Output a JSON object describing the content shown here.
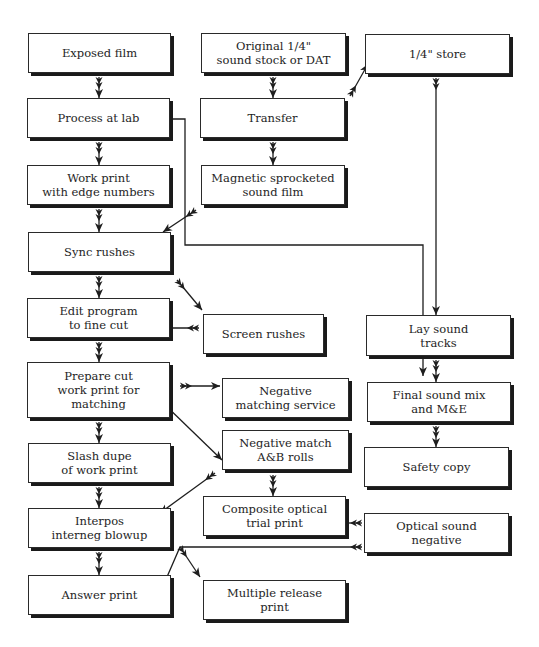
{
  "diagram": {
    "colors": {
      "ink": "#1e1e1e",
      "box_fill": "#ffffff",
      "shadow": "#1a1a1a"
    },
    "nodes": [
      {
        "id": "exposed-film",
        "label": "Exposed film",
        "x": 28,
        "y": 33,
        "w": 143,
        "h": 40
      },
      {
        "id": "original-sound",
        "label": "Original 1/4\"\nsound stock or DAT",
        "x": 201,
        "y": 33,
        "w": 145,
        "h": 40
      },
      {
        "id": "quarter-store",
        "label": "1/4\" store",
        "x": 365,
        "y": 34,
        "w": 145,
        "h": 40
      },
      {
        "id": "process-at-lab",
        "label": "Process at lab",
        "x": 27,
        "y": 98,
        "w": 143,
        "h": 40
      },
      {
        "id": "transfer",
        "label": "Transfer",
        "x": 200,
        "y": 98,
        "w": 145,
        "h": 40
      },
      {
        "id": "work-print",
        "label": "Work print\nwith edge numbers",
        "x": 27,
        "y": 165,
        "w": 143,
        "h": 40
      },
      {
        "id": "magnetic-film",
        "label": "Magnetic sprocketed\nsound film",
        "x": 201,
        "y": 165,
        "w": 144,
        "h": 40
      },
      {
        "id": "sync-rushes",
        "label": "Sync rushes",
        "x": 28,
        "y": 232,
        "w": 143,
        "h": 40
      },
      {
        "id": "edit-program",
        "label": "Edit program\nto fine cut",
        "x": 27,
        "y": 298,
        "w": 143,
        "h": 40
      },
      {
        "id": "screen-rushes",
        "label": "Screen rushes",
        "x": 203,
        "y": 314,
        "w": 121,
        "h": 40
      },
      {
        "id": "lay-sound",
        "label": "Lay sound\ntracks",
        "x": 366,
        "y": 315,
        "w": 145,
        "h": 41
      },
      {
        "id": "prepare-cut",
        "label": "Prepare cut\nwork print for\nmatching",
        "x": 27,
        "y": 362,
        "w": 143,
        "h": 56
      },
      {
        "id": "neg-matching-service",
        "label": "Negative\nmatching service",
        "x": 222,
        "y": 378,
        "w": 127,
        "h": 40
      },
      {
        "id": "final-mix",
        "label": "Final sound mix\nand M&E",
        "x": 367,
        "y": 382,
        "w": 144,
        "h": 40
      },
      {
        "id": "neg-match-ab",
        "label": "Negative match\nA&B rolls",
        "x": 222,
        "y": 430,
        "w": 127,
        "h": 40
      },
      {
        "id": "slash-dupe",
        "label": "Slash dupe\nof work print",
        "x": 28,
        "y": 443,
        "w": 143,
        "h": 40
      },
      {
        "id": "safety-copy",
        "label": "Safety copy",
        "x": 364,
        "y": 447,
        "w": 145,
        "h": 40
      },
      {
        "id": "composite",
        "label": "Composite optical\ntrial print",
        "x": 203,
        "y": 496,
        "w": 143,
        "h": 40
      },
      {
        "id": "interpos",
        "label": "Interpos\ninterneg blowup",
        "x": 28,
        "y": 508,
        "w": 143,
        "h": 40
      },
      {
        "id": "optical-sound-neg",
        "label": "Optical sound\nnegative",
        "x": 364,
        "y": 513,
        "w": 145,
        "h": 40
      },
      {
        "id": "answer-print",
        "label": "Answer print",
        "x": 28,
        "y": 575,
        "w": 143,
        "h": 40
      },
      {
        "id": "multiple-release",
        "label": "Multiple release\nprint",
        "x": 203,
        "y": 580,
        "w": 143,
        "h": 40
      }
    ],
    "edges": [
      {
        "from": "exposed-film",
        "to": "process-at-lab",
        "points": [
          [
            99,
            77
          ],
          [
            99,
            98
          ]
        ]
      },
      {
        "from": "process-at-lab",
        "to": "work-print",
        "points": [
          [
            99,
            142
          ],
          [
            99,
            165
          ]
        ]
      },
      {
        "from": "work-print",
        "to": "sync-rushes",
        "points": [
          [
            99,
            209
          ],
          [
            99,
            232
          ]
        ]
      },
      {
        "from": "sync-rushes",
        "to": "edit-program",
        "points": [
          [
            99,
            276
          ],
          [
            99,
            298
          ]
        ]
      },
      {
        "from": "edit-program",
        "to": "prepare-cut",
        "points": [
          [
            99,
            342
          ],
          [
            99,
            362
          ]
        ]
      },
      {
        "from": "prepare-cut",
        "to": "slash-dupe",
        "points": [
          [
            99,
            422
          ],
          [
            99,
            443
          ]
        ]
      },
      {
        "from": "slash-dupe",
        "to": "interpos",
        "points": [
          [
            99,
            487
          ],
          [
            99,
            508
          ]
        ]
      },
      {
        "from": "interpos",
        "to": "answer-print",
        "points": [
          [
            99,
            552
          ],
          [
            99,
            575
          ]
        ]
      },
      {
        "from": "original-sound",
        "to": "transfer",
        "points": [
          [
            273,
            77
          ],
          [
            273,
            98
          ]
        ]
      },
      {
        "from": "transfer",
        "to": "magnetic-film",
        "points": [
          [
            273,
            142
          ],
          [
            273,
            165
          ]
        ]
      },
      {
        "from": "transfer",
        "to": "quarter-store",
        "points": [
          [
            350,
            96
          ],
          [
            368,
            64
          ]
        ]
      },
      {
        "from": "quarter-store",
        "to": "lay-sound",
        "points": [
          [
            436,
            78
          ],
          [
            436,
            315
          ]
        ]
      },
      {
        "from": "process-at-lab",
        "to": "neg-matching-service",
        "points": [
          [
            160,
            119
          ],
          [
            185,
            119
          ],
          [
            185,
            245
          ],
          [
            423,
            245
          ],
          [
            423,
            376
          ]
        ]
      },
      {
        "from": "magnetic-film",
        "to": "sync-rushes",
        "points": [
          [
            196,
            210
          ],
          [
            163,
            232
          ]
        ]
      },
      {
        "from": "sync-rushes",
        "to": "screen-rushes",
        "points": [
          [
            177,
            280
          ],
          [
            202,
            310
          ]
        ]
      },
      {
        "from": "screen-rushes",
        "to": "edit-program",
        "points": [
          [
            199,
            328
          ],
          [
            157,
            328
          ]
        ]
      },
      {
        "from": "prepare-cut",
        "to": "neg-matching-service",
        "points": [
          [
            180,
            386
          ],
          [
            220,
            386
          ]
        ]
      },
      {
        "from": "prepare-cut",
        "to": "neg-match-ab",
        "points": [
          [
            160,
            400
          ],
          [
            222,
            460
          ]
        ]
      },
      {
        "from": "neg-match-ab",
        "to": "composite",
        "points": [
          [
            273,
            475
          ],
          [
            273,
            496
          ]
        ]
      },
      {
        "from": "neg-match-ab",
        "to": "interpos",
        "points": [
          [
            215,
            473
          ],
          [
            160,
            513
          ]
        ]
      },
      {
        "from": "lay-sound",
        "to": "final-mix",
        "points": [
          [
            436,
            360
          ],
          [
            436,
            382
          ]
        ]
      },
      {
        "from": "final-mix",
        "to": "safety-copy",
        "points": [
          [
            436,
            426
          ],
          [
            436,
            447
          ]
        ]
      },
      {
        "from": "optical-sound-neg",
        "to": "composite",
        "points": [
          [
            362,
            523
          ],
          [
            330,
            523
          ]
        ]
      },
      {
        "from": "optical-sound-neg",
        "to": "answer-print",
        "points": [
          [
            362,
            547
          ],
          [
            180,
            547
          ],
          [
            157,
            600
          ]
        ]
      },
      {
        "from": "optical-sound-neg",
        "to": "multiple-release",
        "points": [
          [
            180,
            547
          ],
          [
            200,
            577
          ]
        ]
      }
    ]
  }
}
